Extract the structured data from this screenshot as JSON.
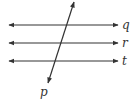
{
  "diagram": {
    "type": "parallel-lines-transversal",
    "colors": {
      "line": "#333333",
      "label": "#333333",
      "background": "#ffffff"
    },
    "parallel_lines": [
      {
        "name": "q",
        "label": "q",
        "y": 25,
        "x1": 9,
        "x2": 118
      },
      {
        "name": "r",
        "label": "r",
        "y": 43,
        "x1": 9,
        "x2": 118
      },
      {
        "name": "t",
        "label": "t",
        "y": 61,
        "x1": 9,
        "x2": 118
      }
    ],
    "transversal": {
      "name": "p",
      "label": "p",
      "x1": 74,
      "y1": 2,
      "x2": 48,
      "y2": 83
    }
  }
}
